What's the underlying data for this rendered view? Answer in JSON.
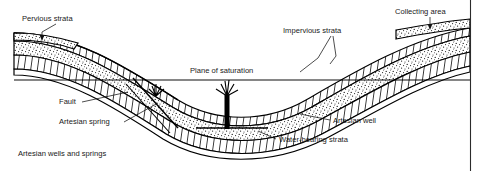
{
  "figure": {
    "caption": "Artesian wells and springs",
    "labels": [
      {
        "id": "pervious-strata",
        "text": "Pervious strata",
        "x": 22,
        "y": 21
      },
      {
        "id": "impervious-strata",
        "text": "Impervious strata",
        "x": 283,
        "y": 33
      },
      {
        "id": "collecting-area",
        "text": "Collecting area",
        "x": 395,
        "y": 14
      },
      {
        "id": "plane-of-saturation",
        "text": "Plane of saturation",
        "x": 190,
        "y": 73
      },
      {
        "id": "fault",
        "text": "Fault",
        "x": 59,
        "y": 104
      },
      {
        "id": "artesian-spring",
        "text": "Artesian spring",
        "x": 59,
        "y": 124
      },
      {
        "id": "artesian-well",
        "text": "Artesian well",
        "x": 333,
        "y": 123
      },
      {
        "id": "water-bearing-strata",
        "text": "Water-bearing strata",
        "x": 279,
        "y": 142
      }
    ],
    "legend_patterns": [
      {
        "id": "pervious-fill",
        "name": "stippled-sand-pattern",
        "meaning": "Pervious / water-bearing strata"
      },
      {
        "id": "impervious-fill",
        "name": "diagonal-hatch-pattern",
        "meaning": "Impervious strata"
      }
    ],
    "features": [
      {
        "id": "artesian-well-pipe",
        "name": "artesian-well",
        "x": 228,
        "y": 120
      },
      {
        "id": "artesian-spring-vent",
        "name": "artesian-spring",
        "x": 160,
        "y": 95
      },
      {
        "id": "fault-line",
        "name": "fault",
        "x": 150,
        "y": 100
      }
    ],
    "colors": {
      "ink": "#000000",
      "text": "#1a1a1a",
      "background": "#ffffff",
      "frame": "#2b2b2b"
    }
  }
}
